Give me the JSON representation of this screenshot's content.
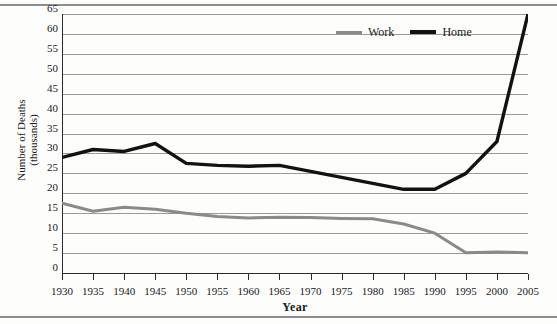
{
  "chart_data": {
    "type": "line",
    "title": "",
    "xlabel": "Year",
    "ylabel_line1": "Number of Deaths",
    "ylabel_line2": "(thousands)",
    "x": [
      1930,
      1935,
      1940,
      1945,
      1950,
      1955,
      1960,
      1965,
      1970,
      1975,
      1980,
      1985,
      1990,
      1995,
      2000,
      2005
    ],
    "xtick_labels": [
      "1930",
      "1935",
      "1940",
      "1945",
      "1950",
      "1955",
      "1960",
      "1965",
      "1970",
      "1975",
      "1980",
      "1985",
      "1990",
      "1995",
      "2000",
      "2005"
    ],
    "ytick_labels": [
      "0",
      "5",
      "10",
      "15",
      "20",
      "25",
      "30",
      "35",
      "40",
      "45",
      "50",
      "55",
      "60",
      "65"
    ],
    "yticks": [
      0,
      5,
      10,
      15,
      20,
      25,
      30,
      35,
      40,
      45,
      50,
      55,
      60,
      65
    ],
    "ylim": [
      0,
      65
    ],
    "xlim": [
      1930,
      2005
    ],
    "grid": true,
    "legend_position": "top-right",
    "series": [
      {
        "name": "Work",
        "color": "#8a8a8a",
        "values": [
          17.5,
          15.5,
          16.5,
          16.0,
          15.0,
          14.2,
          13.8,
          14.0,
          13.9,
          13.7,
          13.6,
          12.3,
          10.0,
          5.1,
          5.3,
          5.1
        ]
      },
      {
        "name": "Home",
        "color": "#121212",
        "values": [
          29.0,
          31.0,
          30.5,
          32.5,
          27.5,
          27.0,
          26.8,
          27.0,
          25.5,
          24.0,
          22.5,
          21.0,
          21.0,
          25.0,
          33.0,
          65.0
        ]
      }
    ]
  },
  "legend": {
    "items": [
      {
        "label": "Work",
        "color": "#8a8a8a"
      },
      {
        "label": "Home",
        "color": "#121212"
      }
    ]
  },
  "axes": {
    "x_title": "Year",
    "y_title_line1": "Number of Deaths",
    "y_title_line2": "(thousands)"
  }
}
